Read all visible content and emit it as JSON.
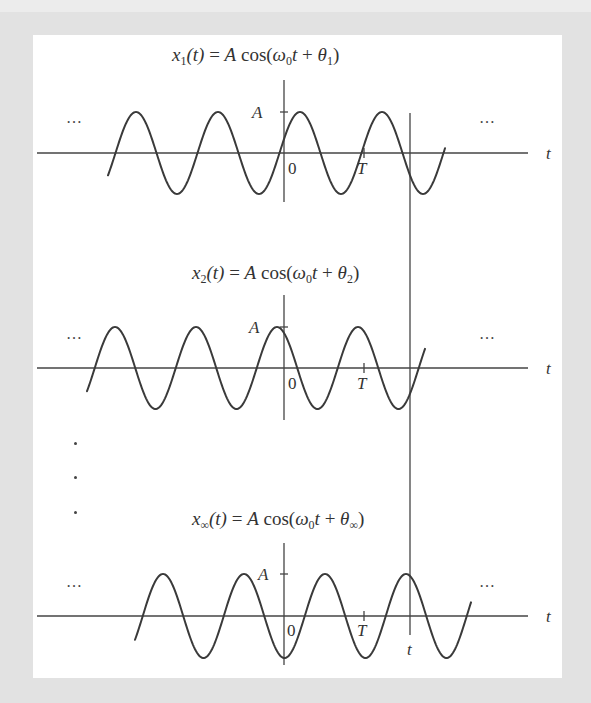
{
  "figure": {
    "background_color": "#e2e2e2",
    "panel_color": "#ffffff",
    "line_color": "#333333",
    "long_vertical_line_label": "t",
    "axis_label": "t",
    "ellipsis": "…",
    "vertical_ellipsis": [
      ".",
      ".",
      "."
    ]
  },
  "panels": [
    {
      "title": {
        "lhs_var": "x",
        "lhs_sub": "1",
        "lhs_arg": "(t)",
        "eq": " = ",
        "amp": "A",
        "func": " cos(",
        "omega": "ω",
        "omega_sub": "0",
        "t": "t",
        "plus": " + ",
        "theta": "θ",
        "theta_sub": "1",
        "close": ")"
      },
      "amplitude_label": "A",
      "origin_label": "0",
      "period_label": "T",
      "axis_label": "t"
    },
    {
      "title": {
        "lhs_var": "x",
        "lhs_sub": "2",
        "lhs_arg": "(t)",
        "eq": " = ",
        "amp": "A",
        "func": " cos(",
        "omega": "ω",
        "omega_sub": "0",
        "t": "t",
        "plus": " + ",
        "theta": "θ",
        "theta_sub": "2",
        "close": ")"
      },
      "amplitude_label": "A",
      "origin_label": "0",
      "period_label": "T",
      "axis_label": "t"
    },
    {
      "title": {
        "lhs_var": "x",
        "lhs_sub": "∞",
        "lhs_arg": "(t)",
        "eq": " = ",
        "amp": "A",
        "func": " cos(",
        "omega": "ω",
        "omega_sub": "0",
        "t": "t",
        "plus": " + ",
        "theta": "θ",
        "theta_sub": "∞",
        "close": ")"
      },
      "amplitude_label": "A",
      "origin_label": "0",
      "period_label": "T",
      "axis_label": "t",
      "sample_time_label": "t"
    }
  ]
}
